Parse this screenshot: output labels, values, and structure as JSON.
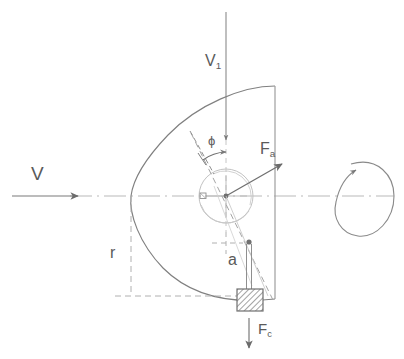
{
  "diagram": {
    "labels": {
      "inflow_velocity": "V",
      "relative_velocity": "V",
      "relative_velocity_sub": "1",
      "aerodynamic_force": "F",
      "aerodynamic_force_sub": "a",
      "centrifugal_force": "F",
      "centrifugal_force_sub": "c",
      "radius": "r",
      "offset": "a",
      "angle": "ϕ"
    },
    "elements": {
      "inflow_arrow": "arrow-right",
      "inflow_velocity_arrow": "arrow-down",
      "aero_force_arrow": "arrow-up-right",
      "centrifugal_force_arrow": "arrow-down",
      "rotation_indicator": "rotation-loop-arrow",
      "counterweight": "hatched-square-mass",
      "hub": "circle-hub",
      "blade_profile": "parabolic-blade-outline",
      "centerline": "dash-dot-axis",
      "radius_guide": "dashed-line",
      "offset_guide": "dashed-crosshair"
    },
    "colors": {
      "line": "#6b6b6b",
      "light_line": "#9a9a9a",
      "very_light_line": "#c4c4c4",
      "text": "#5a5a5a",
      "hatch": "#8c8c8c",
      "background": "#ffffff"
    }
  }
}
